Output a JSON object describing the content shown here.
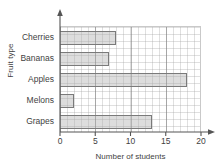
{
  "chart_data": {
    "type": "bar",
    "orientation": "horizontal",
    "title": "",
    "xlabel": "Number of students",
    "ylabel": "Fruit type",
    "categories": [
      "Cherries",
      "Bananas",
      "Apples",
      "Melons",
      "Grapes"
    ],
    "values": [
      8,
      7,
      18,
      2,
      13
    ],
    "xlim": [
      0,
      20
    ],
    "xticks": [
      0,
      5,
      10,
      15,
      20
    ],
    "xtick_labels": [
      "0",
      "5",
      "10",
      "15",
      "20"
    ],
    "grid": true,
    "minor_grid_step": 1,
    "major_grid_step": 5,
    "legend": "none",
    "bar_fill_color": "#afafaf",
    "bar_border_color": "#7a7a7a",
    "grid_color": "#a0a0a0",
    "axis_color": "#555555",
    "text_color": "#3f3f3f"
  }
}
